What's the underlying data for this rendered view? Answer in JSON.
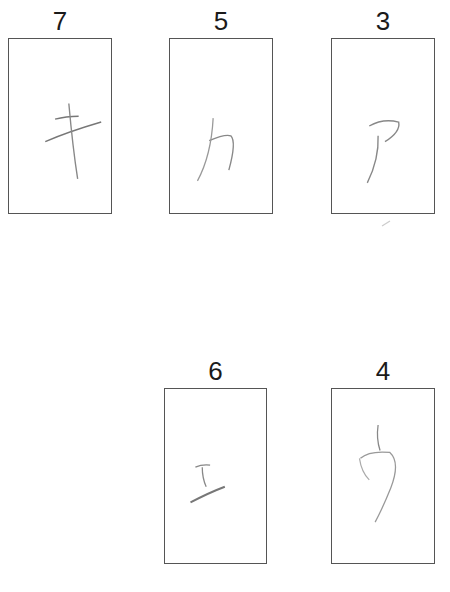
{
  "cards": [
    {
      "number": "7",
      "character": "キ",
      "glyph_name": "katakana-ki"
    },
    {
      "number": "5",
      "character": "カ",
      "glyph_name": "katakana-ka"
    },
    {
      "number": "3",
      "character": "ア",
      "glyph_name": "katakana-a"
    },
    {
      "number": "6",
      "character": "エ",
      "glyph_name": "katakana-e"
    },
    {
      "number": "4",
      "character": "ウ",
      "glyph_name": "katakana-u"
    }
  ],
  "colors": {
    "stroke": "#888888",
    "border": "#555555",
    "text": "#1a1a1a"
  }
}
